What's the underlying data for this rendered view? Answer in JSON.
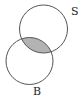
{
  "diagram": {
    "type": "venn",
    "sets": [
      {
        "label": "S",
        "cx": 43.5,
        "cy": 29,
        "r": 24
      },
      {
        "label": "B",
        "cx": 29.5,
        "cy": 61,
        "r": 23.5
      }
    ],
    "shaded_region": "S ∩ B",
    "shade_color": "#b3b3b3",
    "stroke_color": "#555555"
  },
  "labels": {
    "s": "S",
    "b": "B"
  }
}
